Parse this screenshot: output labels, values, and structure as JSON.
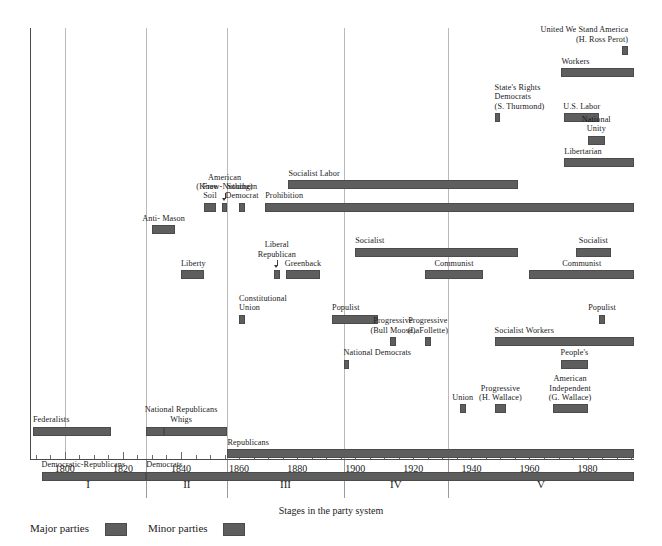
{
  "chart_data": {
    "type": "bar",
    "title": "",
    "xlabel": "Stages in the party system",
    "ylabel": "",
    "orientation": "horizontal-timeline",
    "xlim": [
      1788,
      1996
    ],
    "grid": true,
    "legend_position": "bottom-left",
    "tick_labels": [
      "1800",
      "1820",
      "1840",
      "1860",
      "1880",
      "1900",
      "1920",
      "1940",
      "1960",
      "1980"
    ],
    "tick_values": [
      1800,
      1820,
      1840,
      1860,
      1880,
      1900,
      1920,
      1940,
      1960,
      1980
    ],
    "minor_tick_interval": 5,
    "stages": [
      {
        "label": "I",
        "start": 1788,
        "end": 1828
      },
      {
        "label": "II",
        "start": 1828,
        "end": 1856
      },
      {
        "label": "III",
        "start": 1856,
        "end": 1896
      },
      {
        "label": "IV",
        "start": 1896,
        "end": 1932
      },
      {
        "label": "V",
        "start": 1932,
        "end": 1996
      }
    ],
    "gridline_years": [
      1800,
      1828,
      1856,
      1896,
      1932
    ],
    "series": [
      {
        "name": "Major parties",
        "color": "#5e5e5e",
        "values": [
          {
            "label": "Federalists",
            "start": 1789,
            "end": 1816,
            "row": 18,
            "label_pos": "above-left"
          },
          {
            "label": "National Republicans",
            "start": 1828,
            "end": 1834,
            "row": 18,
            "label_pos": "above-center",
            "label_group": "nr-whigs"
          },
          {
            "label": "Whigs",
            "start": 1834,
            "end": 1856,
            "row": 18,
            "label_pos": "above-center",
            "label_group": "nr-whigs"
          },
          {
            "label": "Republicans",
            "start": 1856,
            "end": 1996,
            "row": 19,
            "label_pos": "above-left"
          },
          {
            "label": "Democratic-Republicans",
            "start": 1792,
            "end": 1828,
            "row": 20,
            "label_pos": "above-left"
          },
          {
            "label": "Democrats",
            "start": 1828,
            "end": 1996,
            "row": 20,
            "label_pos": "above-left"
          }
        ]
      },
      {
        "name": "Minor parties",
        "color": "#5e5e5e",
        "values": [
          {
            "label": "United We Stand America\n(H. Ross Perot)",
            "start": 1992,
            "end": 1994,
            "row": 1,
            "label_pos": "above-right"
          },
          {
            "label": "Workers",
            "start": 1971,
            "end": 1996,
            "row": 2,
            "label_pos": "above-left"
          },
          {
            "label": "State's Rights\nDemocrats\n(S. Thurmond)",
            "start": 1948,
            "end": 1950,
            "row": 4,
            "label_pos": "above-left"
          },
          {
            "label": "U.S. Labor",
            "start": 1972,
            "end": 1984,
            "row": 4,
            "label_pos": "above-center"
          },
          {
            "label": "National\nUnity",
            "start": 1980,
            "end": 1986,
            "row": 5,
            "label_pos": "above-center"
          },
          {
            "label": "Libertarian",
            "start": 1972,
            "end": 1996,
            "row": 6,
            "label_pos": "above-left"
          },
          {
            "label": "Socialist Labor",
            "start": 1877,
            "end": 1956,
            "row": 7,
            "label_pos": "above-left"
          },
          {
            "label": "Free\nSoil",
            "start": 1848,
            "end": 1852,
            "row": 8,
            "label_pos": "above-center"
          },
          {
            "label": "American\n(Know-Nothing)",
            "start": 1854,
            "end": 1856,
            "row": 8,
            "label_pos": "above-center-arrow"
          },
          {
            "label": "Southern\nDemocrat",
            "start": 1860,
            "end": 1862,
            "row": 8,
            "label_pos": "above-center"
          },
          {
            "label": "Prohibition",
            "start": 1869,
            "end": 1996,
            "row": 8,
            "label_pos": "above-left"
          },
          {
            "label": "Anti- Mason",
            "start": 1830,
            "end": 1838,
            "row": 9,
            "label_pos": "above-center"
          },
          {
            "label": "Socialist",
            "start": 1900,
            "end": 1956,
            "row": 10,
            "label_pos": "above-left"
          },
          {
            "label": "Socialist",
            "start": 1976,
            "end": 1988,
            "row": 10,
            "label_pos": "above-center"
          },
          {
            "label": "Liberal\nRepublican",
            "start": 1872,
            "end": 1874,
            "row": 11,
            "label_pos": "above-center-arrow"
          },
          {
            "label": "Liberty",
            "start": 1840,
            "end": 1848,
            "row": 11,
            "label_pos": "above-left"
          },
          {
            "label": "Greenback",
            "start": 1876,
            "end": 1888,
            "row": 11,
            "label_pos": "above-center"
          },
          {
            "label": "Communist",
            "start": 1924,
            "end": 1944,
            "row": 11,
            "label_pos": "above-center"
          },
          {
            "label": "Communist",
            "start": 1960,
            "end": 1996,
            "row": 11,
            "label_pos": "above-center"
          },
          {
            "label": "Constitutional\nUnion",
            "start": 1860,
            "end": 1862,
            "row": 13,
            "label_pos": "above-left"
          },
          {
            "label": "Populist",
            "start": 1892,
            "end": 1908,
            "row": 13,
            "label_pos": "above-left"
          },
          {
            "label": "Populist",
            "start": 1984,
            "end": 1986,
            "row": 13,
            "label_pos": "above-center"
          },
          {
            "label": "Progressive\n(Bull Moose)",
            "start": 1912,
            "end": 1914,
            "row": 14,
            "label_pos": "above-center"
          },
          {
            "label": "Progressive\n(LaFollette)",
            "start": 1924,
            "end": 1926,
            "row": 14,
            "label_pos": "above-center"
          },
          {
            "label": "Socialist Workers",
            "start": 1948,
            "end": 1996,
            "row": 14,
            "label_pos": "above-left"
          },
          {
            "label": "National Democrats",
            "start": 1896,
            "end": 1898,
            "row": 15,
            "label_pos": "above-left"
          },
          {
            "label": "People's",
            "start": 1971,
            "end": 1980,
            "row": 15,
            "label_pos": "above-center"
          },
          {
            "label": "Union",
            "start": 1936,
            "end": 1938,
            "row": 17,
            "label_pos": "above-center"
          },
          {
            "label": "Progressive\n(H. Wallace)",
            "start": 1948,
            "end": 1952,
            "row": 17,
            "label_pos": "above-center"
          },
          {
            "label": "American\nIndependent\n(G. Wallace)",
            "start": 1968,
            "end": 1980,
            "row": 17,
            "label_pos": "above-center"
          }
        ]
      }
    ],
    "legend": [
      {
        "label": "Major parties",
        "color": "#5e5e5e"
      },
      {
        "label": "Minor parties",
        "color": "#5e5e5e"
      }
    ]
  }
}
